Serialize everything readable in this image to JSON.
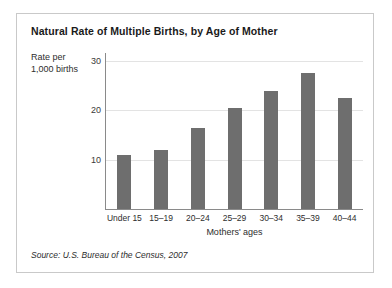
{
  "chart_data": {
    "type": "bar",
    "title": "Natural Rate of Multiple Births, by Age of Mother",
    "categories": [
      "Under 15",
      "15–19",
      "20–24",
      "25–29",
      "30–34",
      "35–39",
      "40–44"
    ],
    "values": [
      11,
      12,
      16.5,
      20.5,
      24,
      27.5,
      22.5
    ],
    "xlabel": "Mothers' ages",
    "ylabel": "Rate per\n1,000 births",
    "ylabel_line1": "Rate per",
    "ylabel_line2": "1,000 births",
    "ylim": [
      0,
      30
    ],
    "yticks": [
      30,
      20,
      10
    ],
    "ytick_labels": [
      "30",
      "20",
      "10"
    ],
    "grid": true,
    "legend": false,
    "bar_color": "#6e6e6e",
    "grid_color": "#e3e3e3",
    "axis_color": "#8a8a8a"
  },
  "source": {
    "text": "Source: U.S. Bureau of the Census, 2007"
  }
}
